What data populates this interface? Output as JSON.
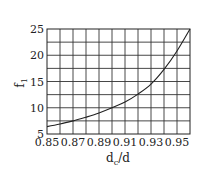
{
  "chart_data": {
    "type": "line",
    "title": "",
    "xlabel": "d_c/d",
    "xlabel_main": "d",
    "xlabel_sub": "c",
    "xlabel_tail": "/d",
    "ylabel": "f_1",
    "ylabel_main": "f",
    "ylabel_sub": "1",
    "xlim": [
      0.85,
      0.96
    ],
    "ylim": [
      5,
      25
    ],
    "x_ticks": [
      0.85,
      0.87,
      0.89,
      0.91,
      0.93,
      0.95
    ],
    "x_tick_labels": [
      "0.85",
      "0.87",
      "0.89",
      "0.91",
      "0.93",
      "0.95"
    ],
    "y_ticks": [
      5,
      10,
      15,
      20,
      25
    ],
    "y_tick_labels": [
      "5",
      "10",
      "15",
      "20",
      "25"
    ],
    "grid": true,
    "grid_x_step": 0.01,
    "grid_y_step": 2.5,
    "legend": null,
    "series": [
      {
        "name": "f1",
        "x": [
          0.85,
          0.86,
          0.87,
          0.88,
          0.89,
          0.9,
          0.91,
          0.92,
          0.93,
          0.94,
          0.95,
          0.96
        ],
        "values": [
          6.4,
          6.9,
          7.5,
          8.2,
          9.0,
          10.0,
          11.1,
          12.6,
          14.5,
          17.3,
          20.8,
          25.0
        ]
      }
    ]
  }
}
